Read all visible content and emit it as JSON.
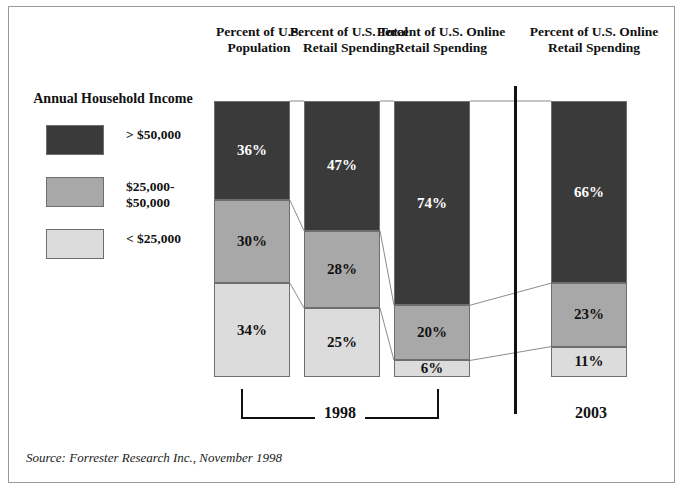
{
  "source_note": "Source: Forrester Research Inc., November 1998",
  "legend": {
    "title": "Annual Household\nIncome",
    "items": [
      {
        "label": "> $50,000",
        "color": "#3a3a3a",
        "text_color": "#ffffff"
      },
      {
        "label": "$25,000-\n$50,000",
        "color": "#a8a8a8",
        "text_color": "#111111"
      },
      {
        "label": "< $25,000",
        "color": "#dcdcdc",
        "text_color": "#111111"
      }
    ]
  },
  "groups": [
    {
      "label": "1998",
      "bars": [
        0,
        1,
        2
      ]
    },
    {
      "label": "2003",
      "bars": [
        3
      ]
    }
  ],
  "chart_data": {
    "type": "bar",
    "subtype": "stacked-bar-100-percent",
    "title": "",
    "xlabel": "",
    "ylabel": "",
    "ylim": [
      0,
      100
    ],
    "grid": false,
    "legend_position": "left",
    "categories": [
      "Percent of\nU.S. Population",
      "Percent of U.S.\nTotal Retail\nSpending",
      "Percent of U.S.\nOnline Retail\nSpending",
      "Percent of U.S.\nOnline Retail\nSpending"
    ],
    "group_labels": [
      "1998",
      "1998",
      "1998",
      "2003"
    ],
    "series": [
      {
        "name": "> $50,000",
        "color": "#3a3a3a",
        "values": [
          36,
          47,
          74,
          66
        ],
        "value_labels": [
          "36%",
          "47%",
          "74%",
          "66%"
        ]
      },
      {
        "name": "$25,000-$50,000",
        "color": "#a8a8a8",
        "values": [
          30,
          28,
          20,
          23
        ],
        "value_labels": [
          "30%",
          "28%",
          "20%",
          "23%"
        ]
      },
      {
        "name": "< $25,000",
        "color": "#dcdcdc",
        "values": [
          34,
          25,
          6,
          11
        ],
        "value_labels": [
          "34%",
          "25%",
          "6%",
          "11%"
        ]
      }
    ]
  }
}
